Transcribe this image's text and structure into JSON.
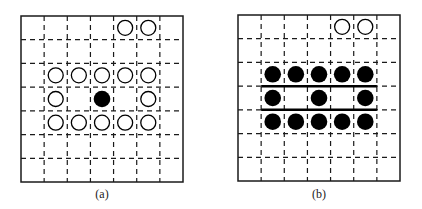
{
  "figure": {
    "grid_size": 7,
    "colors": {
      "line": "#1a1a1a",
      "filled": "#000000",
      "hollow_fill": "#ffffff",
      "background": "#ffffff"
    },
    "panels": [
      {
        "id": "a",
        "caption": "(a)",
        "hollow": [
          [
            0,
            4
          ],
          [
            0,
            5
          ],
          [
            2,
            1
          ],
          [
            2,
            2
          ],
          [
            2,
            3
          ],
          [
            2,
            4
          ],
          [
            2,
            5
          ],
          [
            3,
            1
          ],
          [
            3,
            5
          ],
          [
            4,
            1
          ],
          [
            4,
            2
          ],
          [
            4,
            3
          ],
          [
            4,
            4
          ],
          [
            4,
            5
          ]
        ],
        "filled": [
          [
            3,
            3
          ]
        ],
        "solid_lines": []
      },
      {
        "id": "b",
        "caption": "(b)",
        "hollow": [
          [
            0,
            4
          ],
          [
            0,
            5
          ]
        ],
        "filled": [
          [
            2,
            1
          ],
          [
            2,
            2
          ],
          [
            2,
            3
          ],
          [
            2,
            4
          ],
          [
            2,
            5
          ],
          [
            3,
            1
          ],
          [
            3,
            3
          ],
          [
            3,
            5
          ],
          [
            4,
            1
          ],
          [
            4,
            2
          ],
          [
            4,
            3
          ],
          [
            4,
            4
          ],
          [
            4,
            5
          ]
        ],
        "solid_lines": [
          {
            "row_boundary": 3,
            "from_col": 1,
            "to_col": 6
          },
          {
            "row_boundary": 4,
            "from_col": 1,
            "to_col": 6
          }
        ]
      }
    ]
  }
}
